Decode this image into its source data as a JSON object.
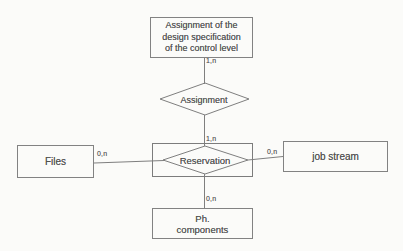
{
  "diagram": {
    "kind": "entity-relationship-diagram",
    "colors": {
      "background": "#fbfbf9",
      "line": "#7f7f7f",
      "text": "#525252"
    },
    "entities": {
      "control_level": {
        "lines": [
          "Assignment of the",
          "design specification",
          "of the control level"
        ]
      },
      "files": {
        "label": "Files"
      },
      "job_stream": {
        "label": "job stream"
      },
      "ph_components": {
        "lines": [
          "Ph.",
          "components"
        ]
      }
    },
    "relationships": {
      "assignment": {
        "label": "Assignment"
      },
      "reservation": {
        "label": "Reservation"
      }
    },
    "cardinalities": {
      "control_to_assignment": "1,n",
      "assignment_to_reservation": "1,n",
      "files_to_reservation": "0,n",
      "reservation_to_job_stream": "0,n",
      "reservation_to_ph_components": "0,n"
    }
  }
}
